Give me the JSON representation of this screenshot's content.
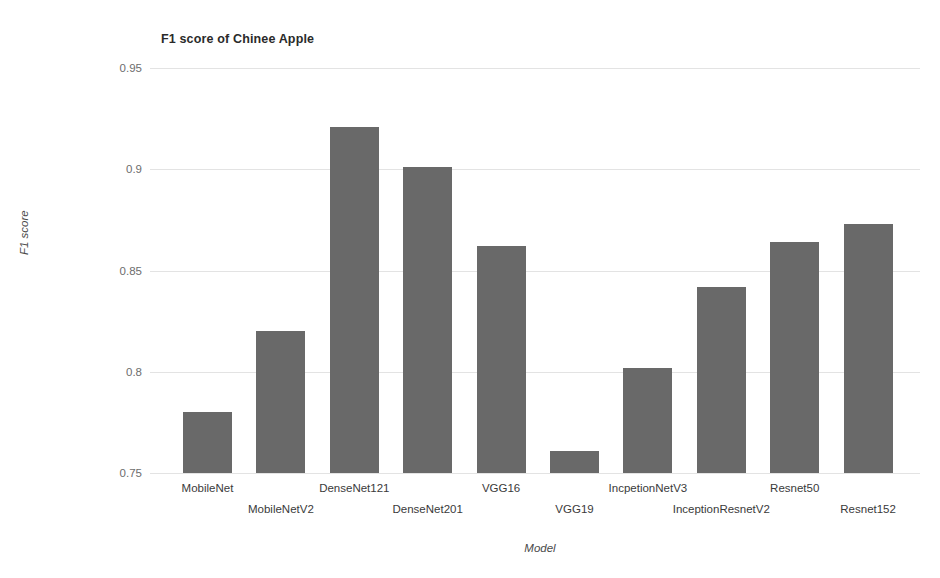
{
  "chart_data": {
    "type": "bar",
    "title": "F1 score of Chinee Apple",
    "xlabel": "Model",
    "ylabel": "F1 score",
    "ylim": [
      0.75,
      0.95
    ],
    "yticks": [
      0.95,
      0.9,
      0.85,
      0.8,
      0.75
    ],
    "ytick_labels": [
      "0.95",
      "0.9",
      "0.85",
      "0.8",
      "0.75"
    ],
    "grid": true,
    "legend": null,
    "bar_color": "#696969",
    "categories": [
      "MobileNet",
      "MobileNetV2",
      "DenseNet121",
      "DenseNet201",
      "VGG16",
      "VGG19",
      "IncpetionNetV3",
      "InceptionResnetV2",
      "Resnet50",
      "Resnet152"
    ],
    "values": [
      0.78,
      0.82,
      0.921,
      0.901,
      0.862,
      0.761,
      0.802,
      0.842,
      0.864,
      0.873
    ]
  }
}
